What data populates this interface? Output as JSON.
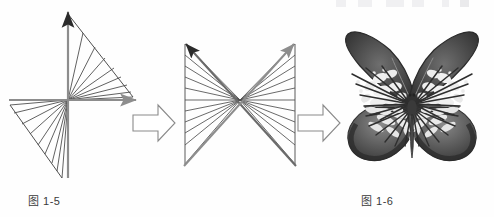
{
  "page": {
    "background": "#fefefe",
    "width": 494,
    "height": 217
  },
  "palette": {
    "ink_dark": "#2b2b2b",
    "ink_line": "#5a5a5a",
    "axis_gray": "#8d8d8d",
    "caption_text": "#3a3a3a",
    "connector_outline": "#8a8a8a",
    "butterfly_dark": "#3b3b3b",
    "butterfly_mid": "#6e6e6e",
    "butterfly_pale": "#f2f2f2"
  },
  "figures": [
    {
      "id": "fig-1-5",
      "caption": "图 1-5",
      "kind": "axes-fan-diagram",
      "description": "Coordinate axes with a fan of straight lines radiating from the origin, forming triangular lobes in the upper-right and lower-left quadrants",
      "origin": {
        "x": 68,
        "y": 100
      },
      "axes": [
        {
          "name": "vertical-axis",
          "color": "#8d8d8d",
          "arrowhead": "#2b2b2b",
          "from": [
            68,
            175
          ],
          "to": [
            68,
            10
          ]
        },
        {
          "name": "horizontal-axis",
          "color": "#8d8d8d",
          "arrowhead": "#8d8d8d",
          "from": [
            10,
            100
          ],
          "to": [
            138,
            100
          ]
        }
      ],
      "fan_upper_right": {
        "ray_count": 9,
        "edge_from": [
          68,
          14
        ],
        "edge_to": [
          133,
          97
        ]
      },
      "fan_lower_left": {
        "ray_count": 9,
        "edge_from": [
          10,
          105
        ],
        "edge_to": [
          62,
          178
        ]
      }
    },
    {
      "id": "fig-1-6",
      "caption": "图 1-6",
      "kind": "bowtie-fan-diagram",
      "description": "Hourglass / bowtie of fan lines converging at a central point, bounded by two vertical rails, with two long gray diagonal arrows crossing through the centre",
      "center": {
        "x": 75,
        "y": 100
      },
      "rails": [
        {
          "name": "left-rail",
          "from": [
            20,
            44
          ],
          "to": [
            20,
            163
          ]
        },
        {
          "name": "right-rail",
          "from": [
            130,
            44
          ],
          "to": [
            130,
            163
          ]
        }
      ],
      "fan_line_count_per_side": 11,
      "diagonal_arrows": [
        {
          "name": "arrow-upper-left",
          "color": "#6a6a6a",
          "arrowhead": "#2b2b2b",
          "from": [
            131,
            164
          ],
          "to": [
            19,
            42
          ]
        },
        {
          "name": "arrow-upper-right",
          "color": "#8d8d8d",
          "arrowhead": "#8d8d8d",
          "from": [
            19,
            164
          ],
          "to": [
            131,
            42
          ]
        }
      ]
    },
    {
      "id": "fig-1-7",
      "caption": "图 1-7",
      "kind": "butterfly-photograph",
      "description": "Grayscale specimen photo of a tiger-pattern butterfly with spread wings, dark veins, pale cell patches, slender body and two curved antennae"
    }
  ],
  "connectors": [
    {
      "id": "connector-1",
      "name": "block-arrow-right",
      "label": "→",
      "direction": "right",
      "style": "outlined"
    },
    {
      "id": "connector-2",
      "name": "block-arrow-right",
      "label": "→",
      "direction": "right",
      "style": "outlined"
    }
  ]
}
